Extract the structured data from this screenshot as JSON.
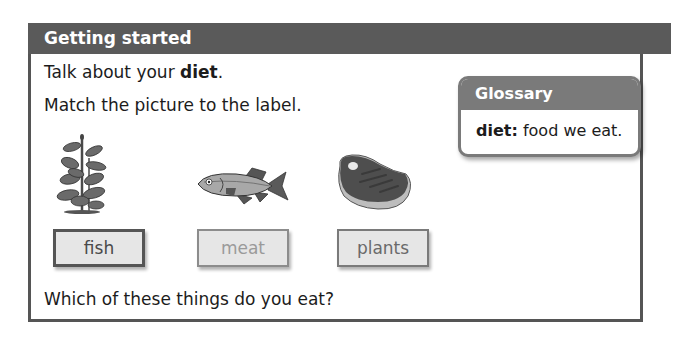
{
  "panel": {
    "title": "Getting started",
    "line1_prefix": "Talk about your ",
    "line1_bold": "diet",
    "line1_suffix": ".",
    "line2": "Match the picture to the label.",
    "question": "Which of these things do you eat?"
  },
  "glossary": {
    "title": "Glossary",
    "term": "diet:",
    "definition": " food we eat."
  },
  "pictures": [
    {
      "name": "plant-picture",
      "icon": "plant-icon"
    },
    {
      "name": "fish-picture",
      "icon": "fish-icon"
    },
    {
      "name": "meat-picture",
      "icon": "meat-steak-icon"
    }
  ],
  "labels": [
    {
      "text": "fish"
    },
    {
      "text": "meat"
    },
    {
      "text": "plants"
    }
  ],
  "colors": {
    "header_bg": "#5a5a5a",
    "glossary_header_bg": "#7a7a7a",
    "label_bg": "#e6e6e6"
  }
}
